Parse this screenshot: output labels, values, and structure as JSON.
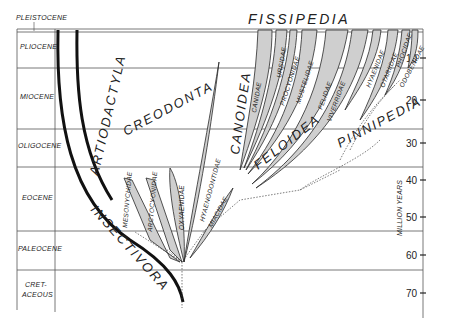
{
  "diagram": {
    "title_top": "FISSIPEDIA",
    "pleistocene_label": "PLEISTOCENE",
    "epochs": [
      {
        "label": "PLIOCENE",
        "y": 49
      },
      {
        "label": "MIOCENE",
        "y": 99
      },
      {
        "label": "OLIGOCENE",
        "y": 148
      },
      {
        "label": "EOCENE",
        "y": 200
      },
      {
        "label": "PALEOCENE",
        "y": 251
      },
      {
        "label": "CRET-",
        "y": 287
      },
      {
        "label": "ACEOUS",
        "y": 296
      }
    ],
    "axis": {
      "label": "MILLION YEARS",
      "ticks": [
        "10",
        "20",
        "30",
        "40",
        "50",
        "60",
        "70"
      ]
    },
    "groups": {
      "insectivora": "INSECTIVORA",
      "artiodactyla": "ARTIODACTYLA",
      "creodonta": "CREODONTA",
      "canoidea": "CANOIDEA",
      "feloidea": "FELOIDEA",
      "pinnipedia": "PINNIPEDIA"
    },
    "families": {
      "mesonychidae": "MESONYCHIDAE",
      "arctocyonidae": "ARCTOCYONIDAE",
      "oxyaenidae": "OXYAENIDAE",
      "hyaenodontidae": "HYAENODONTIDAE",
      "miacidae": "MIACIDAE",
      "canidae": "CANIDAE",
      "ursidae": "URSIDAE",
      "procyonidae": "PROCYONIDAE",
      "mustelidae": "MUSTELIDAE",
      "felidae": "FELIDAE",
      "viverridae": "VIVERRIDAE",
      "hyaenidae": "HYAENIDAE",
      "otariidae": "OTARIIDAE",
      "phocidae": "PHOCIDAE",
      "odobenidae": "ODOBENIDAE"
    }
  }
}
